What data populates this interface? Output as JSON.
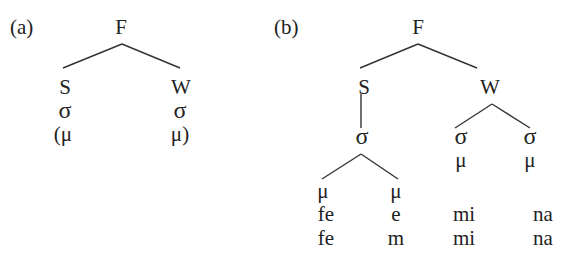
{
  "panel_a": {
    "label": "(a)",
    "root": "F",
    "strong": "S",
    "weak": "W",
    "syll_strong": "σ",
    "syll_weak": "σ",
    "mora_strong": "(μ",
    "mora_weak": "μ)"
  },
  "panel_b": {
    "label": "(b)",
    "root": "F",
    "strong": "S",
    "weak": "W",
    "syll_strong": "σ",
    "syll_weak_1": "σ",
    "syll_weak_2": "σ",
    "mora_weak_1": "μ",
    "mora_weak_2": "μ",
    "mora_strong_1": "μ",
    "mora_strong_2": "μ",
    "row1": [
      "fe",
      "e",
      "mi",
      "na"
    ],
    "row2": [
      "fe",
      "m",
      "mi",
      "na"
    ]
  }
}
